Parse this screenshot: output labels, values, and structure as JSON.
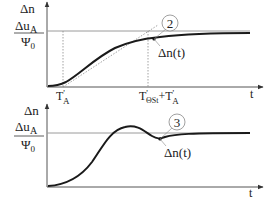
{
  "colors": {
    "curve": "#1a1a1a",
    "axis": "#555555",
    "reference": "#9a9a9a",
    "dashed": "#8a8a8a",
    "background": "#ffffff"
  },
  "top_plot": {
    "y_label": "Δn",
    "ref_numerator": "Δu",
    "ref_numerator_sub": "A",
    "ref_denominator": "Ψ",
    "ref_denominator_sub": "0",
    "x_label": "t",
    "tick_1_main": "T",
    "tick_1_prime": "'",
    "tick_1_sub": "A",
    "tick_2_main": "T",
    "tick_2_prime": "'",
    "tick_2_sub": "ΘSt",
    "tick_2_plus": "+T",
    "tick_2_prime2": "'",
    "tick_2_sub2": "A",
    "callout_number": "2",
    "curve_label": "Δn(t)"
  },
  "bottom_plot": {
    "y_label": "Δn",
    "ref_numerator": "Δu",
    "ref_numerator_sub": "A",
    "ref_denominator": "Ψ",
    "ref_denominator_sub": "0",
    "x_label": "t",
    "callout_number": "3",
    "curve_label": "Δn(t)"
  }
}
